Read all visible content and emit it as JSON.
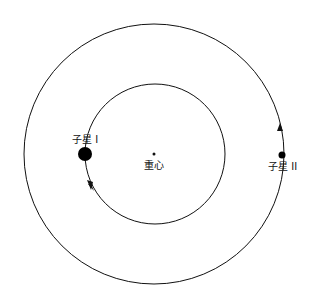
{
  "diagram": {
    "type": "binary-star-orbit",
    "labels": {
      "star1": "子星 I",
      "star2": "子星 II",
      "barycenter": "重心"
    },
    "colors": {
      "line": "#111111",
      "background": "#ffffff"
    }
  }
}
